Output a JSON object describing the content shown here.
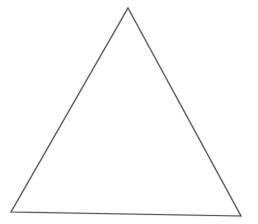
{
  "figure": {
    "title": "",
    "caption": "",
    "type": "line-drawing",
    "shape_name": "triangle",
    "background_color": "#ffffff",
    "stroke_color": "#555555",
    "stroke_halo_color": "#8a8a8a",
    "fill_color": "none",
    "stroke_width_px": 1.15,
    "canvas": {
      "width": 258,
      "height": 224
    },
    "vertices": [
      {
        "label": "apex",
        "x": 128,
        "y": 8
      },
      {
        "label": "bottom-right",
        "x": 241,
        "y": 216
      },
      {
        "label": "bottom-left",
        "x": 11,
        "y": 212
      }
    ],
    "polygon_points": "128,8 241,216 11,212",
    "edges": [
      {
        "name": "left-edge",
        "from": "bottom-left",
        "to": "apex"
      },
      {
        "name": "right-edge",
        "from": "apex",
        "to": "bottom-right"
      },
      {
        "name": "base-edge",
        "from": "bottom-right",
        "to": "bottom-left"
      }
    ]
  }
}
